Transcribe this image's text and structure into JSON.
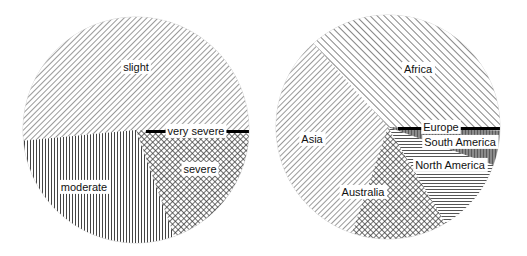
{
  "chart_data": [
    {
      "type": "pie",
      "title": "",
      "start_angle_deg": 0,
      "direction": "counterclockwise",
      "slices": [
        {
          "label": "slight",
          "value": 51.5,
          "pattern": "diag-fwd"
        },
        {
          "label": "moderate",
          "value": 29.0,
          "pattern": "vertical"
        },
        {
          "label": "severe",
          "value": 19.0,
          "pattern": "crosshatch"
        },
        {
          "label": "very severe",
          "value": 0.5,
          "pattern": "solid-black"
        }
      ],
      "legend": "none",
      "labels": "inside"
    },
    {
      "type": "pie",
      "title": "",
      "start_angle_deg": 0,
      "direction": "counterclockwise",
      "slices": [
        {
          "label": "Africa",
          "value": 36.6,
          "pattern": "diag-back"
        },
        {
          "label": "Asia",
          "value": 33.2,
          "pattern": "diag-fwd"
        },
        {
          "label": "Australia",
          "value": 13.8,
          "pattern": "crosshatch"
        },
        {
          "label": "North America",
          "value": 10.9,
          "pattern": "horizontal"
        },
        {
          "label": "South America",
          "value": 5.0,
          "pattern": "gray-stipple"
        },
        {
          "label": "Europe",
          "value": 0.5,
          "pattern": "solid-black"
        }
      ],
      "legend": "none",
      "labels": "inside"
    }
  ]
}
